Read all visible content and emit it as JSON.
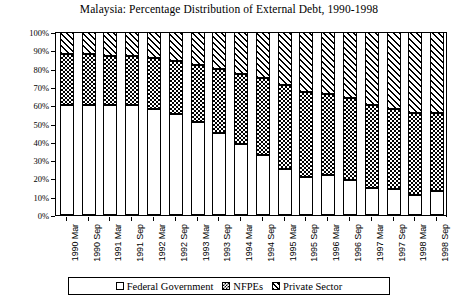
{
  "chart_data": {
    "type": "bar",
    "subtype": "stacked-percentage-column",
    "title": "Malaysia: Percentage Distribution of External Debt, 1990-1998",
    "xlabel": "",
    "ylabel": "Percentage",
    "ylim": [
      0,
      100
    ],
    "ytick_labels": [
      "0%",
      "10%",
      "20%",
      "30%",
      "40%",
      "50%",
      "60%",
      "70%",
      "80%",
      "90%",
      "100%"
    ],
    "ytick_values": [
      0,
      10,
      20,
      30,
      40,
      50,
      60,
      70,
      80,
      90,
      100
    ],
    "grid": false,
    "legend_position": "bottom",
    "categories": [
      "1990 Mar",
      "1990 Sep",
      "1991 Mar",
      "1991 Sep",
      "1992 Mar",
      "1992 Sep",
      "1993 Mar",
      "1993 Sep",
      "1994 Mar",
      "1994 Sep",
      "1995 Mar",
      "1995 Sep",
      "1996 Mar",
      "1996 Sep",
      "1997 Mar",
      "1997 Sep",
      "1998 Mar",
      "1998 Sep"
    ],
    "series": [
      {
        "name": "Federal Government",
        "pattern": "solid-white",
        "values": [
          60,
          60,
          60,
          60,
          58,
          55,
          51,
          45,
          39,
          33,
          25,
          21,
          22,
          19,
          15,
          14,
          11,
          13
        ]
      },
      {
        "name": "NFPEs",
        "pattern": "crosshatch",
        "values": [
          28,
          28,
          27,
          27,
          28,
          29,
          31,
          35,
          38,
          42,
          46,
          46,
          44,
          45,
          45,
          44,
          45,
          43
        ]
      },
      {
        "name": "Private Sector",
        "pattern": "diagonal-hatch",
        "values": [
          12,
          12,
          13,
          13,
          14,
          16,
          18,
          20,
          23,
          25,
          29,
          33,
          34,
          36,
          40,
          42,
          44,
          44
        ]
      }
    ]
  },
  "legend": {
    "items": [
      {
        "label": "Federal  Government",
        "swatch": "federal-swatch"
      },
      {
        "label": "NFPEs",
        "swatch": "nfpes-swatch"
      },
      {
        "label": "Private Sector",
        "swatch": "private-sector-swatch"
      }
    ]
  }
}
